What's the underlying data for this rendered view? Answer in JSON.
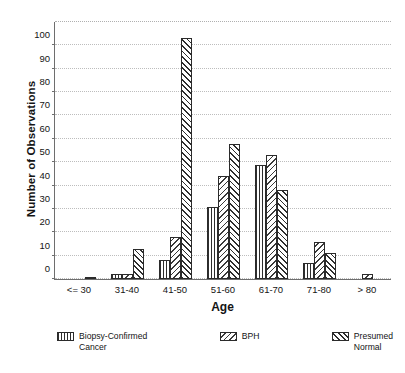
{
  "chart_data": {
    "type": "bar",
    "title": "",
    "xlabel": "Age",
    "ylabel": "Number of Observations",
    "categories": [
      "<= 30",
      "31-40",
      "41-50",
      "51-60",
      "61-70",
      "71-80",
      "> 80"
    ],
    "series": [
      {
        "name": "Biopsy-Confirmed Cancer",
        "pattern": "vertical-lines",
        "values": [
          0,
          2,
          8,
          31,
          49,
          7,
          0
        ]
      },
      {
        "name": "BPH",
        "pattern": "backslash-hatch",
        "values": [
          0,
          2,
          18,
          44,
          53,
          16,
          2
        ]
      },
      {
        "name": "Presumed Normal",
        "pattern": "forward-slash-hatch",
        "values": [
          1,
          13,
          103,
          58,
          38,
          11,
          0
        ]
      }
    ],
    "ylim": [
      0,
      110
    ],
    "yticks": [
      0,
      10,
      20,
      30,
      40,
      50,
      60,
      70,
      80,
      90,
      100
    ],
    "grid": true,
    "legend_position": "bottom"
  },
  "legend": {
    "items": [
      {
        "label_line1": "Biopsy-Confirmed",
        "label_line2": "Cancer"
      },
      {
        "label_line1": "BPH",
        "label_line2": ""
      },
      {
        "label_line1": "Presumed",
        "label_line2": "Normal"
      }
    ]
  }
}
